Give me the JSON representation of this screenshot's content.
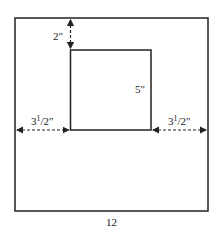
{
  "diagram": {
    "outer_rect": {
      "width_label": "12"
    },
    "inner_rect": {
      "height_label": "5\""
    },
    "dimensions": {
      "top_gap": "2\"",
      "left_gap": {
        "whole": "3",
        "num": "1",
        "den": "2\""
      },
      "right_gap": {
        "whole": "3",
        "num": "1",
        "den": "2\""
      }
    },
    "colors": {
      "line": "#222222",
      "background": "#ffffff"
    }
  }
}
